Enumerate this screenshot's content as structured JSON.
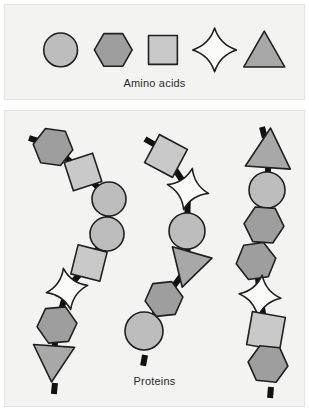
{
  "figure": {
    "width": 309,
    "height": 411
  },
  "colors": {
    "page_background": "#ffffff",
    "panel_background": "#f3f3f1",
    "panel_border": "#e3e3e0",
    "outline": "#231f20",
    "bond": "#111111",
    "text": "#2b2b2b",
    "circle_fill": "#bdbdbd",
    "hexagon_fill": "#9e9e9e",
    "square_fill": "#c9c9c9",
    "star_fill": "#fbfbfa",
    "triangle_fill": "#a8a8a8"
  },
  "legend": {
    "caption": "Amino acids",
    "items": [
      {
        "name": "circle",
        "shape": "circle",
        "fill": "#bdbdbd",
        "cx": 56,
        "cy": 45,
        "size": 34
      },
      {
        "name": "hexagon",
        "shape": "hexagon",
        "fill": "#9e9e9e",
        "cx": 109,
        "cy": 45,
        "size": 38
      },
      {
        "name": "square",
        "shape": "square",
        "fill": "#c9c9c9",
        "cx": 159,
        "cy": 45,
        "size": 33
      },
      {
        "name": "star",
        "shape": "star",
        "fill": "#fbfbfa",
        "cx": 211,
        "cy": 45,
        "size": 44
      },
      {
        "name": "triangle",
        "shape": "triangle",
        "fill": "#a8a8a8",
        "cx": 261,
        "cy": 47,
        "size": 42
      }
    ]
  },
  "chains_panel": {
    "caption": "Proteins",
    "chains": [
      {
        "name": "protein-chain-left",
        "residues": [
          {
            "shape": "hexagon",
            "cx": 48,
            "cy": 36,
            "size": 40,
            "rot": 8
          },
          {
            "shape": "square",
            "cx": 78,
            "cy": 61,
            "size": 34,
            "rot": -18
          },
          {
            "shape": "circle",
            "cx": 104,
            "cy": 88,
            "size": 34,
            "rot": 0
          },
          {
            "shape": "circle",
            "cx": 102,
            "cy": 123,
            "size": 34,
            "rot": 0
          },
          {
            "shape": "square",
            "cx": 84,
            "cy": 152,
            "size": 34,
            "rot": 14
          },
          {
            "shape": "star",
            "cx": 62,
            "cy": 178,
            "size": 42,
            "rot": -10
          },
          {
            "shape": "hexagon",
            "cx": 52,
            "cy": 214,
            "size": 40,
            "rot": -5
          },
          {
            "shape": "triangle",
            "cx": 48,
            "cy": 250,
            "size": 42,
            "rot": 184
          }
        ],
        "terminals": [
          {
            "x": 24,
            "y": 27,
            "angle": 18
          },
          {
            "x": 50,
            "y": 272,
            "angle": 96
          }
        ]
      },
      {
        "name": "protein-chain-middle",
        "residues": [
          {
            "shape": "square",
            "cx": 161,
            "cy": 45,
            "size": 36,
            "rot": 28
          },
          {
            "shape": "star",
            "cx": 183,
            "cy": 78,
            "size": 42,
            "rot": 12
          },
          {
            "shape": "circle",
            "cx": 182,
            "cy": 120,
            "size": 36,
            "rot": 0
          },
          {
            "shape": "triangle",
            "cx": 183,
            "cy": 156,
            "size": 42,
            "rot": 196
          },
          {
            "shape": "hexagon",
            "cx": 159,
            "cy": 188,
            "size": 38,
            "rot": -6
          },
          {
            "shape": "circle",
            "cx": 139,
            "cy": 220,
            "size": 38,
            "rot": 0
          }
        ],
        "terminals": [
          {
            "x": 140,
            "y": 28,
            "angle": 30
          },
          {
            "x": 140,
            "y": 244,
            "angle": 100
          }
        ]
      },
      {
        "name": "protein-chain-right",
        "residues": [
          {
            "shape": "triangle",
            "cx": 264,
            "cy": 40,
            "size": 46,
            "rot": 4
          },
          {
            "shape": "circle",
            "cx": 262,
            "cy": 79,
            "size": 36,
            "rot": 0
          },
          {
            "shape": "hexagon",
            "cx": 259,
            "cy": 114,
            "size": 40,
            "rot": 4
          },
          {
            "shape": "hexagon",
            "cx": 251,
            "cy": 150,
            "size": 40,
            "rot": -8
          },
          {
            "shape": "star",
            "cx": 255,
            "cy": 185,
            "size": 42,
            "rot": 6
          },
          {
            "shape": "square",
            "cx": 261,
            "cy": 220,
            "size": 38,
            "rot": 10
          },
          {
            "shape": "hexagon",
            "cx": 263,
            "cy": 253,
            "size": 40,
            "rot": 6
          }
        ],
        "terminals": [
          {
            "x": 257,
            "y": 16,
            "angle": 75
          },
          {
            "x": 266,
            "y": 276,
            "angle": 95
          }
        ]
      }
    ]
  }
}
